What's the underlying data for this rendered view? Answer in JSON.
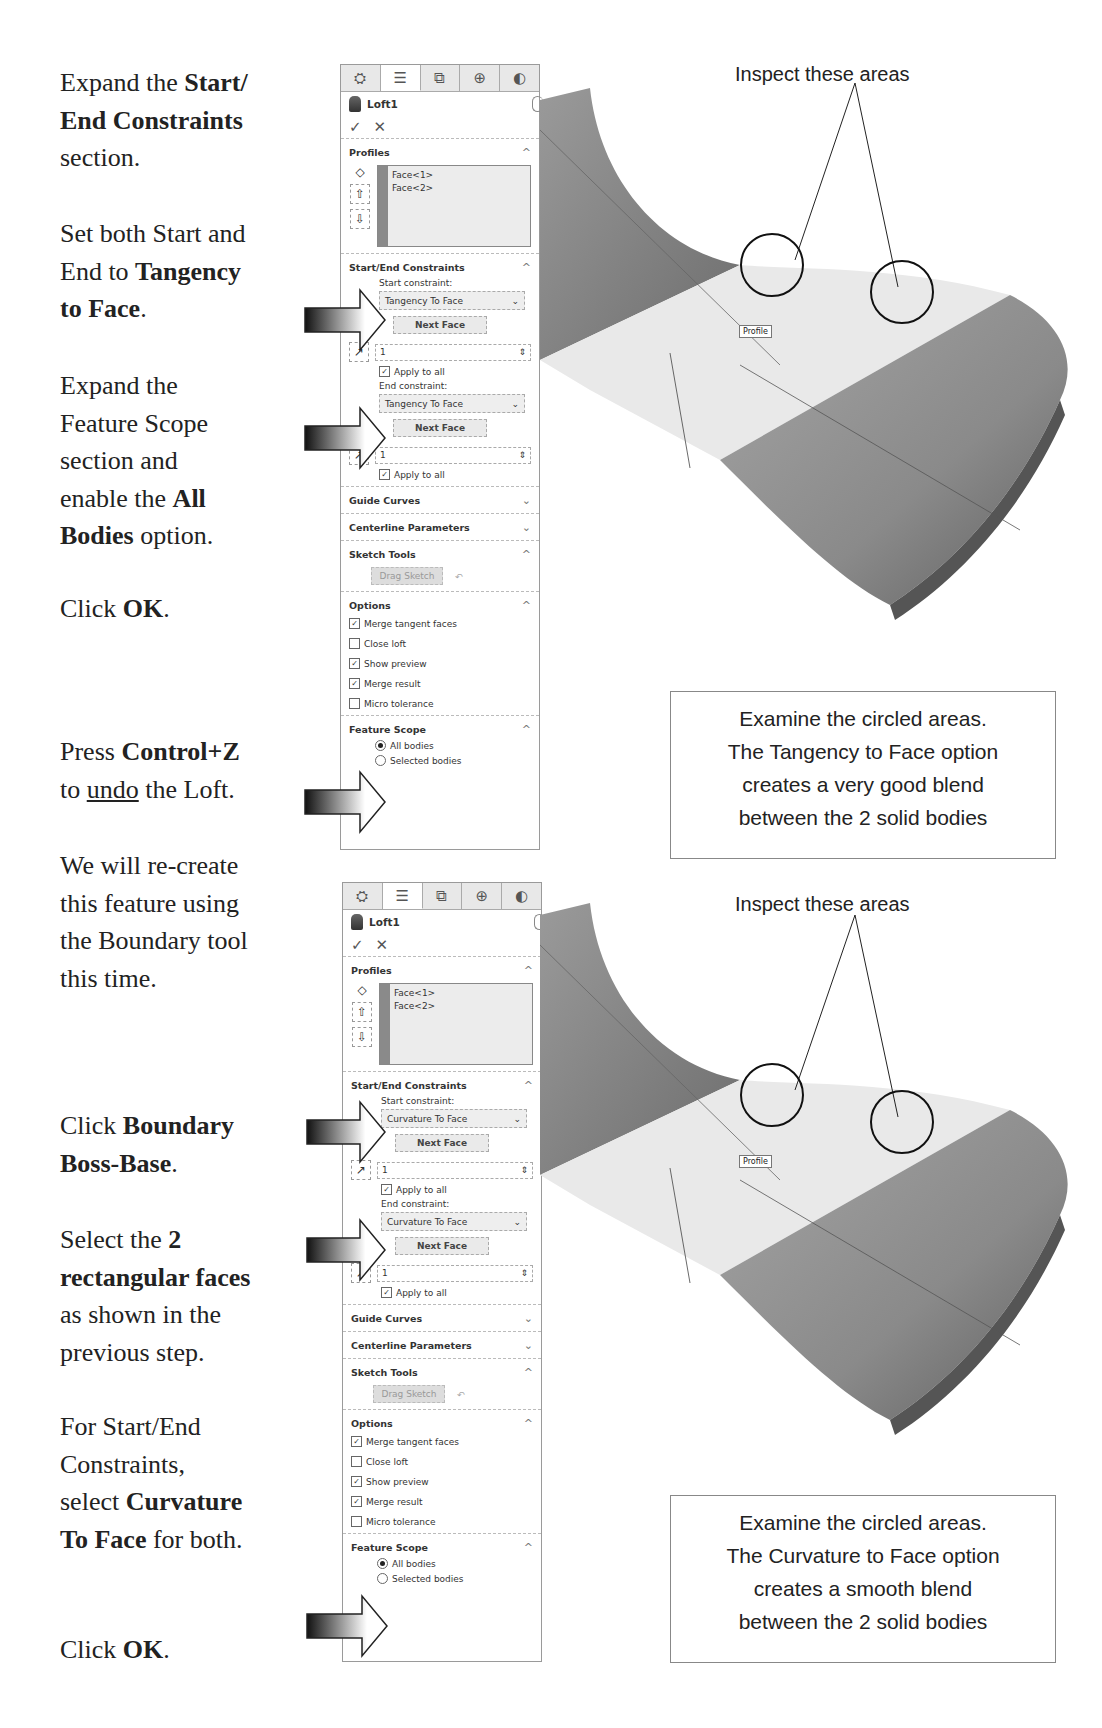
{
  "instructions_top": [
    {
      "parts": [
        {
          "t": "Expand the "
        },
        {
          "t": "Start/",
          "b": true
        }
      ]
    },
    {
      "parts": [
        {
          "t": "End Constraints",
          "b": true
        }
      ]
    },
    {
      "parts": [
        {
          "t": "section."
        }
      ]
    }
  ],
  "text": {
    "p1_l1a": "Expand the ",
    "p1_l1b": "Start/",
    "p1_l2": "End Constraints",
    "p1_l3": "section.",
    "p2_l1": "Set both Start and",
    "p2_l2a": "End to ",
    "p2_l2b": "Tangency",
    "p2_l3a": "to Face",
    "p2_l3b": ".",
    "p3_l1": "Expand the",
    "p3_l2": "Feature Scope",
    "p3_l3": "section and",
    "p3_l4a": "enable the ",
    "p3_l4b": "All",
    "p3_l5a": "Bodies",
    "p3_l5b": " option.",
    "p4_a": "Click ",
    "p4_b": "OK",
    "p4_c": ".",
    "p5_l1a": "Press ",
    "p5_l1b": "Control+Z",
    "p5_l2a": "to ",
    "p5_l2b": "undo",
    "p5_l2c": " the Loft.",
    "p6_l1": "We will re-create",
    "p6_l2": "this feature using",
    "p6_l3": "the Boundary tool",
    "p6_l4": "this time.",
    "p7_l1a": "Click ",
    "p7_l1b": "Boundary",
    "p7_l2a": "Boss-Base",
    "p7_l2b": ".",
    "p8_l1a": "Select the ",
    "p8_l1b": "2",
    "p8_l2": "rectangular faces",
    "p8_l3": "as shown in the",
    "p8_l4": "previous step.",
    "p9_l1": "For Start/End",
    "p9_l2": "Constraints,",
    "p9_l3a": "select ",
    "p9_l3b": "Curvature",
    "p9_l4a": "To Face",
    "p9_l4b": " for both.",
    "p10_a": "Click ",
    "p10_b": "OK",
    "p10_c": "."
  },
  "panels": [
    {
      "feature_name": "Loft1",
      "profiles_label": "Profiles",
      "profiles": [
        "Face<1>",
        "Face<2>"
      ],
      "constraints_label": "Start/End Constraints",
      "start_label": "Start constraint:",
      "start_value": "Tangency To Face",
      "next_face": "Next Face",
      "start_num": "1",
      "apply_all": "Apply to all",
      "end_label": "End constraint:",
      "end_value": "Tangency To Face",
      "end_num": "1",
      "guide_curves": "Guide Curves",
      "centerline": "Centerline Parameters",
      "sketch_tools": "Sketch Tools",
      "drag_sketch": "Drag Sketch",
      "options_label": "Options",
      "options": [
        {
          "label": "Merge tangent faces",
          "checked": true
        },
        {
          "label": "Close loft",
          "checked": false
        },
        {
          "label": "Show preview",
          "checked": true
        },
        {
          "label": "Merge result",
          "checked": true
        },
        {
          "label": "Micro tolerance",
          "checked": false
        }
      ],
      "scope_label": "Feature Scope",
      "scope_options": [
        {
          "label": "All bodies",
          "selected": true
        },
        {
          "label": "Selected bodies",
          "selected": false
        }
      ]
    },
    {
      "feature_name": "Loft1",
      "profiles_label": "Profiles",
      "profiles": [
        "Face<1>",
        "Face<2>"
      ],
      "constraints_label": "Start/End Constraints",
      "start_label": "Start constraint:",
      "start_value": "Curvature To Face",
      "next_face": "Next Face",
      "start_num": "1",
      "apply_all": "Apply to all",
      "end_label": "End constraint:",
      "end_value": "Curvature To Face",
      "end_num": "1",
      "guide_curves": "Guide Curves",
      "centerline": "Centerline Parameters",
      "sketch_tools": "Sketch Tools",
      "drag_sketch": "Drag Sketch",
      "options_label": "Options",
      "options": [
        {
          "label": "Merge tangent faces",
          "checked": true
        },
        {
          "label": "Close loft",
          "checked": false
        },
        {
          "label": "Show preview",
          "checked": true
        },
        {
          "label": "Merge result",
          "checked": true
        },
        {
          "label": "Micro tolerance",
          "checked": false
        }
      ],
      "scope_label": "Feature Scope",
      "scope_options": [
        {
          "label": "All bodies",
          "selected": true
        },
        {
          "label": "Selected bodies",
          "selected": false
        }
      ]
    }
  ],
  "callouts": {
    "inspect_top": "Inspect these areas",
    "inspect_bottom": "Inspect these areas",
    "profile_tag": "Profile",
    "note_top": [
      "Examine the circled areas.",
      "The Tangency to Face option",
      "creates a very good blend",
      "between the 2 solid bodies"
    ],
    "note_bottom": [
      "Examine the circled areas.",
      "The Curvature to Face option",
      "creates a smooth blend",
      "between the 2 solid bodies"
    ]
  },
  "icons": {
    "tab_icons": [
      "feature-manager",
      "property-manager",
      "configuration-manager",
      "dim-xpert",
      "display-manager"
    ],
    "ok": "✓",
    "cancel": "✕",
    "collapse": "^",
    "expand": "⌄",
    "up": "⇧",
    "down": "⇩"
  }
}
